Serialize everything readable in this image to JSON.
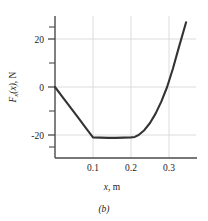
{
  "figure": {
    "caption": "(b)"
  },
  "chart_data": {
    "type": "line",
    "title": "",
    "xlabel_parts": {
      "symbol": "x",
      "rest": ", m"
    },
    "ylabel_parts": {
      "symbol": "F",
      "subscript": "x",
      "arg": "(x)",
      "rest": ", N"
    },
    "xlabel": "x, m",
    "ylabel": "Fx(x), N",
    "xlim": [
      0,
      0.36
    ],
    "ylim": [
      -36,
      32
    ],
    "grid": true,
    "legend": "none",
    "xticks": [
      0.1,
      0.2,
      0.3
    ],
    "xtick_labels": [
      "0.1",
      "0.2",
      "0.3"
    ],
    "yticks": [
      -20,
      0,
      20
    ],
    "ytick_labels": [
      "-20",
      "0",
      "20"
    ],
    "yticks_minor": [
      -30,
      -10,
      10,
      30
    ],
    "series": [
      {
        "name": "Fx(x)",
        "color": "#333333",
        "x": [
          0.0,
          0.02,
          0.04,
          0.06,
          0.08,
          0.1,
          0.12,
          0.14,
          0.16,
          0.18,
          0.2,
          0.21,
          0.22,
          0.235,
          0.25,
          0.265,
          0.28,
          0.295,
          0.31,
          0.325,
          0.345
        ],
        "y": [
          0.0,
          -4.2,
          -8.4,
          -12.6,
          -16.8,
          -21.0,
          -21.1,
          -21.2,
          -21.2,
          -21.1,
          -21.0,
          -20.8,
          -20.0,
          -18.0,
          -15.0,
          -11.0,
          -6.0,
          0.0,
          7.5,
          16.0,
          27.0
        ]
      }
    ],
    "annotations": []
  }
}
